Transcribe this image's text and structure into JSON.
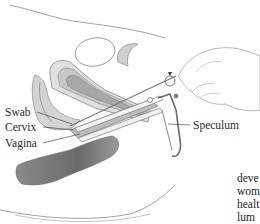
{
  "figure": {
    "type": "anatomical-illustration",
    "labels": [
      {
        "id": "swab",
        "text": "Swab"
      },
      {
        "id": "cervix",
        "text": "Cervix"
      },
      {
        "id": "vagina",
        "text": "Vagina"
      },
      {
        "id": "speculum",
        "text": "Speculum"
      }
    ],
    "colors": {
      "outline": "#7a7a7a",
      "tissue_light": "#e2e2e2",
      "tissue_mid": "#c4c4c4",
      "tissue_dark": "#8c8c8c",
      "rectum_dark": "#6e6e6e"
    }
  },
  "body_text": {
    "lines": [
      "deve",
      "wom",
      "healt",
      "lum"
    ]
  }
}
